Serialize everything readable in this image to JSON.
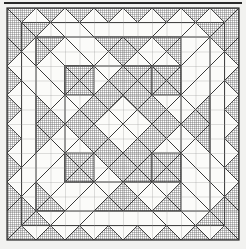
{
  "figure": {
    "caption": "",
    "type": "quilt-block-line-drawing"
  },
  "canvas": {
    "width": 246,
    "height": 249,
    "background_color": "#f2f2f0",
    "paper_color": "#f7f7f5"
  },
  "block": {
    "name": "Medallion Diamond Quilt Block",
    "origin_x": 7,
    "origin_y": 8,
    "size": 232,
    "grid_divisions": 16,
    "cell_size": 14.5
  },
  "colors": {
    "line": "#3a3a3a",
    "heavy_line": "#2b2b2b",
    "light_fabric": "#fbfbf9",
    "hatch_fabric": "#555555",
    "hatch_background": "#ffffff",
    "grid_line": "#8a8a8a",
    "top_rule": "#2a2a2a",
    "page_background": "#f2f2f0"
  },
  "style": {
    "hatch_pitch": 2,
    "hatch_stroke_width": 0.7,
    "grid_stroke_width": 0.55,
    "patch_stroke_width": 0.9,
    "outer_stroke_width": 1.2,
    "top_rule_y": 3,
    "top_rule_thickness": 2
  },
  "legend": {
    "visible": false,
    "entries": [
      {
        "swatch": "light",
        "label": "Light fabric"
      },
      {
        "swatch": "hatched",
        "label": "Dark / print fabric"
      }
    ]
  },
  "chart_data": {
    "type": "table",
    "xlabel": "",
    "ylabel": "",
    "grid": true,
    "legend_position": "none",
    "categories": [
      "center-diamond",
      "inner-corner-squares",
      "diagonal-bands",
      "edge-sawtooth",
      "corner-triangles"
    ],
    "values": [
      1,
      4,
      4,
      16,
      4
    ]
  },
  "patches": {
    "hatched_rects": [
      {
        "x": 0,
        "y": 0,
        "w": 4,
        "h": 4
      },
      {
        "x": 12,
        "y": 0,
        "w": 4,
        "h": 4
      },
      {
        "x": 0,
        "y": 12,
        "w": 4,
        "h": 4
      },
      {
        "x": 12,
        "y": 12,
        "w": 4,
        "h": 4
      },
      {
        "x": 4,
        "y": 4,
        "w": 2,
        "h": 2
      },
      {
        "x": 10,
        "y": 4,
        "w": 2,
        "h": 2
      },
      {
        "x": 4,
        "y": 10,
        "w": 2,
        "h": 2
      },
      {
        "x": 10,
        "y": 10,
        "w": 2,
        "h": 2
      }
    ],
    "hatched_diamond": {
      "cx": 8,
      "cy": 8,
      "r": 3.6
    },
    "light_inner_diamond": {
      "cx": 8,
      "cy": 8,
      "r": 2.4
    }
  }
}
